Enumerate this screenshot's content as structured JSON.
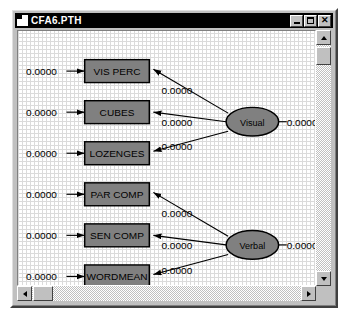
{
  "window": {
    "title": "CFA6.PTH",
    "icon": "document-icon",
    "buttons": {
      "minimize": "minimize-icon",
      "maximize": "maximize-icon",
      "close": "close-icon"
    }
  },
  "diagram": {
    "type": "sem-path-diagram",
    "observed_variables": [
      {
        "id": "vis-perc",
        "label": "VIS PERC",
        "x": 66,
        "y": 30,
        "w": 64,
        "h": 24
      },
      {
        "id": "cubes",
        "label": "CUBES",
        "x": 66,
        "y": 73,
        "w": 64,
        "h": 24
      },
      {
        "id": "lozenges",
        "label": "LOZENGES",
        "x": 66,
        "y": 116,
        "w": 64,
        "h": 24
      },
      {
        "id": "par-comp",
        "label": "PAR COMP",
        "x": 66,
        "y": 159,
        "w": 64,
        "h": 24
      },
      {
        "id": "sen-comp",
        "label": "SEN COMP",
        "x": 66,
        "y": 202,
        "w": 64,
        "h": 24
      },
      {
        "id": "wordmean",
        "label": "WORDMEAN",
        "x": 66,
        "y": 245,
        "w": 64,
        "h": 24
      }
    ],
    "latent_variables": [
      {
        "id": "visual",
        "label": "Visual",
        "cx": 232,
        "cy": 95,
        "rx": 26,
        "ry": 15
      },
      {
        "id": "verbal",
        "label": "Verbal",
        "cx": 232,
        "cy": 224,
        "rx": 26,
        "ry": 15
      }
    ],
    "error_estimates": [
      {
        "id": "err-vis-perc",
        "value": "0.0000",
        "x": 8,
        "y": 42
      },
      {
        "id": "err-cubes",
        "value": "0.0000",
        "x": 8,
        "y": 85
      },
      {
        "id": "err-lozenges",
        "value": "0.0000",
        "x": 8,
        "y": 128
      },
      {
        "id": "err-par-comp",
        "value": "0.0000",
        "x": 8,
        "y": 171
      },
      {
        "id": "err-sen-comp",
        "value": "0.0000",
        "x": 8,
        "y": 214
      },
      {
        "id": "err-wordmean",
        "value": "0.0000",
        "x": 8,
        "y": 257
      }
    ],
    "loading_estimates": [
      {
        "id": "load-visual-vis-perc",
        "value": "0.0000",
        "x": 142,
        "y": 62
      },
      {
        "id": "load-visual-cubes",
        "value": "0.0000",
        "x": 142,
        "y": 99
      },
      {
        "id": "load-visual-lozenges",
        "value": "0.0000",
        "x": 142,
        "y": 131
      },
      {
        "id": "load-verbal-par-comp",
        "value": "0.0000",
        "x": 142,
        "y": 191
      },
      {
        "id": "load-verbal-sen-comp",
        "value": "0.0000",
        "x": 142,
        "y": 228
      },
      {
        "id": "load-verbal-wordmean",
        "value": "0.0000",
        "x": 142,
        "y": 260
      }
    ],
    "variance_estimates": [
      {
        "id": "var-visual",
        "value": "0.0000",
        "x": 264,
        "y": 99
      },
      {
        "id": "var-verbal",
        "value": "0.0000",
        "x": 264,
        "y": 228
      }
    ],
    "colors": {
      "box_fill": "#808080",
      "ellipse_fill": "#808080",
      "stroke": "#000000",
      "canvas": "#ffffff",
      "grid": "#d8d8d8",
      "chrome": "#c0c0c0",
      "titlebar": "#000000"
    }
  },
  "scrollbars": {
    "vertical": {
      "up": "scroll-up-icon",
      "down": "scroll-down-icon",
      "thumb": "vertical-scroll-thumb"
    },
    "horizontal": {
      "left": "scroll-left-icon",
      "right": "scroll-right-icon",
      "thumb": "horizontal-scroll-thumb"
    }
  }
}
